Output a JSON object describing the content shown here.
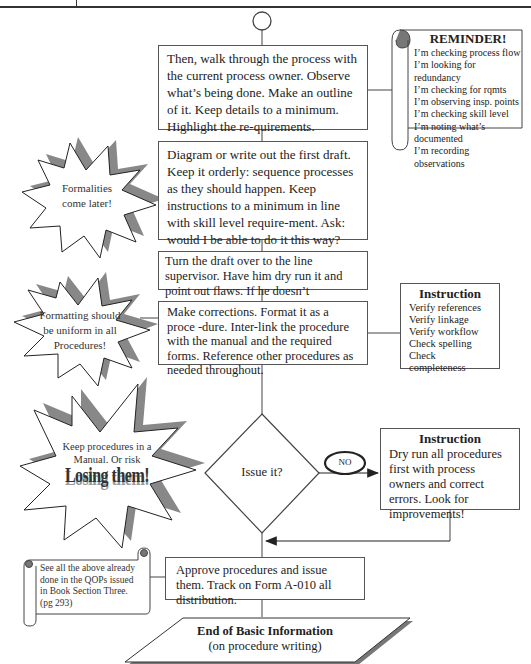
{
  "steps": [
    {
      "id": "walk-through",
      "text": "Then, walk through the process with the current process owner. Observe what’s being done. Make an outline of it. Keep details to a minimum. Highlight the re-quirements."
    },
    {
      "id": "first-draft",
      "text": "Diagram or write out the first draft. Keep it orderly: sequence processes as they should happen. Keep instructions to a minimum in line with skill level require-ment. Ask: would I be able to do it this way?"
    },
    {
      "id": "line-supervisor",
      "text": "Turn the draft over to the line supervisor. Have him dry run it and point out flaws. If he doesn’t understand it, he will not use it."
    },
    {
      "id": "corrections",
      "text": "Make corrections. Format it as a proce -dure. Inter-link the procedure with the manual and the required forms. Reference other procedures as needed throughout."
    },
    {
      "id": "approve",
      "text": "Approve procedures and issue them. Track on Form A-010 all distribution."
    }
  ],
  "decision": {
    "label": "Issue it?",
    "no_label": "NO"
  },
  "end": {
    "title": "End of Basic Information",
    "subtitle": "(on procedure writing)"
  },
  "reminder": {
    "title": "REMINDER!",
    "items": [
      "I’m checking process flow",
      "I’m looking for redundancy",
      "I’m checking for rqmts",
      "I’m observing insp. points",
      "I’m checking skill level",
      "I’m noting what’s documented",
      "I’m recording observations"
    ]
  },
  "instruction_checks": {
    "title": "Instruction",
    "items": [
      "Verify references",
      "Verify linkage",
      "Verify workflow",
      "Check spelling",
      "Check completeness"
    ]
  },
  "instruction_dry_run": {
    "title": "Instruction",
    "text": "Dry run all procedures first with process owners and correct errors. Look for improvements!"
  },
  "callouts": {
    "formalities": "Formalities come later!",
    "formatting": "Formatting should be uniform in all Procedures!",
    "manual_line1": "Keep procedures in a Manual. Or risk",
    "manual_emphasis": "Losing them!"
  },
  "scroll_note": {
    "text": "See all the above already done in the QOPs issued in Book Section Three. (pg 293)"
  },
  "colors": {
    "line": "#444444",
    "shadow": "#8a8a8a",
    "text": "#222222"
  }
}
